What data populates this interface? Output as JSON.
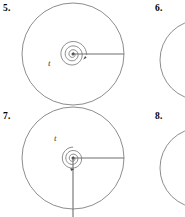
{
  "page": {
    "background_color": "#ffffff",
    "line_color": "#707070",
    "ink_color": "#000000",
    "width": 185,
    "height": 217
  },
  "problems": [
    {
      "id": "problem-5",
      "number_label": "5.",
      "angle_label": "t",
      "figure": {
        "kind": "spiral-angle-diagram",
        "circle": {
          "cx": 57,
          "cy": 54,
          "r": 51
        },
        "spiral": {
          "center_x": 57,
          "center_y": 54,
          "turns": 1.75,
          "start_radius": 1.5,
          "end_radius": 14,
          "direction": "counterclockwise"
        },
        "terminal_rays": [
          {
            "name": "horizontal-right-ray",
            "angle_deg": 0,
            "length": 51
          }
        ],
        "arrow": {
          "x": 68,
          "y": 60,
          "direction": "up-right"
        },
        "label_position": {
          "x": 36,
          "y": 66
        }
      }
    },
    {
      "id": "problem-6",
      "number_label": "6.",
      "figure": {
        "kind": "partial-circle-arc-clipped",
        "arc": {
          "cx": 40,
          "cy": 50,
          "r": 40
        }
      }
    },
    {
      "id": "problem-7",
      "number_label": "7.",
      "angle_label": "t",
      "figure": {
        "kind": "spiral-angle-diagram",
        "circle": {
          "cx": 57,
          "cy": 50,
          "r": 51
        },
        "spiral": {
          "center_x": 57,
          "center_y": 50,
          "turns": 1.6,
          "start_radius": 1.5,
          "end_radius": 13,
          "direction": "clockwise"
        },
        "terminal_rays": [
          {
            "name": "horizontal-right-ray",
            "angle_deg": 0,
            "length": 51
          },
          {
            "name": "vertical-down-ray",
            "angle_deg": 270,
            "length": 67
          }
        ],
        "arrow": {
          "x": 57,
          "y": 64,
          "direction": "down"
        },
        "label_position": {
          "x": 40,
          "y": 40
        }
      }
    },
    {
      "id": "problem-8",
      "number_label": "8.",
      "figure": {
        "kind": "partial-circle-arc-clipped",
        "arc": {
          "cx": 40,
          "cy": 50,
          "r": 40
        }
      }
    }
  ]
}
